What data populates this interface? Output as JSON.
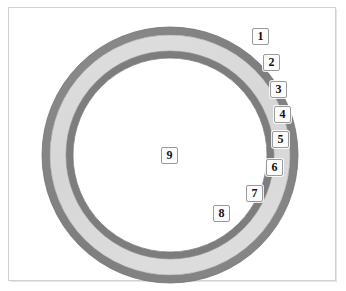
{
  "figure": {
    "type": "concentric-annulus-diagram",
    "background_color": "#ffffff",
    "frame_color": "#d2d2d2",
    "center": {
      "x": 170,
      "y": 155
    },
    "colors": {
      "outer_ring": "#808080",
      "middle_band": "#d9d9d9",
      "inner_ring": "#7d7d7d",
      "core": "#ffffff",
      "stroke": "#6f6f6f"
    },
    "rings": [
      {
        "name": "outer-dark-ring",
        "outer_radius": 128,
        "inner_radius": 120,
        "fill": "#808080"
      },
      {
        "name": "light-band",
        "outer_radius": 120,
        "inner_radius": 104,
        "fill": "#d9d9d9"
      },
      {
        "name": "inner-dark-ring",
        "outer_radius": 104,
        "inner_radius": 97,
        "fill": "#7d7d7d"
      },
      {
        "name": "core",
        "outer_radius": 97,
        "inner_radius": 0,
        "fill": "#ffffff"
      }
    ]
  },
  "callouts": [
    {
      "id": "callout-1",
      "label": "1",
      "x": 252,
      "y": 28
    },
    {
      "id": "callout-2",
      "label": "2",
      "x": 263,
      "y": 54
    },
    {
      "id": "callout-3",
      "label": "3",
      "x": 270,
      "y": 81
    },
    {
      "id": "callout-4",
      "label": "4",
      "x": 274,
      "y": 106
    },
    {
      "id": "callout-5",
      "label": "5",
      "x": 272,
      "y": 131
    },
    {
      "id": "callout-6",
      "label": "6",
      "x": 266,
      "y": 159
    },
    {
      "id": "callout-7",
      "label": "7",
      "x": 246,
      "y": 185
    },
    {
      "id": "callout-8",
      "label": "8",
      "x": 213,
      "y": 205
    },
    {
      "id": "callout-9",
      "label": "9",
      "x": 170,
      "y": 152
    }
  ]
}
